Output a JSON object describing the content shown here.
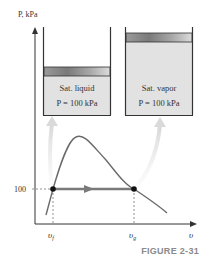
{
  "figure": {
    "caption": "FIGURE 2-31",
    "y_axis_label": "P, kPa",
    "x_axis_label": "υ",
    "tick_y": "100",
    "v_f_label": "υ",
    "v_f_sub": "f",
    "v_g_label": "υ",
    "v_g_sub": "g"
  },
  "cylinders": [
    {
      "title": "Sat. liquid",
      "pressure": "P = 100 kPa",
      "state": "liquid"
    },
    {
      "title": "Sat. vapor",
      "pressure": "P = 100 kPa",
      "state": "vapor"
    }
  ],
  "colors": {
    "fluid_fill": "#e2e2e2",
    "dome_line": "#6a6a6a",
    "process_line": "#7a7a7a",
    "arrow_light": "#dcdcdc",
    "caption": "#8a8a8a"
  }
}
